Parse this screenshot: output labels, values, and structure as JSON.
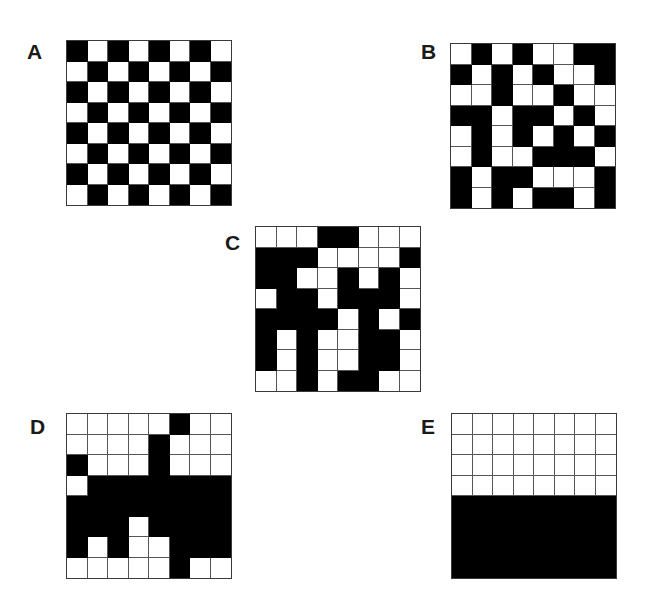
{
  "colors": {
    "filled": "#000000",
    "empty": "#ffffff",
    "gridline": "#555555"
  },
  "panels": [
    {
      "id": "A",
      "label": "A",
      "label_pos": [
        27,
        41
      ],
      "grid_pos": [
        66,
        40
      ],
      "rows": [
        [
          1,
          0,
          1,
          0,
          1,
          0,
          1,
          0
        ],
        [
          0,
          1,
          0,
          1,
          0,
          1,
          0,
          1
        ],
        [
          1,
          0,
          1,
          0,
          1,
          0,
          1,
          0
        ],
        [
          0,
          1,
          0,
          1,
          0,
          1,
          0,
          1
        ],
        [
          1,
          0,
          1,
          0,
          1,
          0,
          1,
          0
        ],
        [
          0,
          1,
          0,
          1,
          0,
          1,
          0,
          1
        ],
        [
          1,
          0,
          1,
          0,
          1,
          0,
          1,
          0
        ],
        [
          0,
          1,
          0,
          1,
          0,
          1,
          0,
          1
        ]
      ]
    },
    {
      "id": "B",
      "label": "B",
      "label_pos": [
        421,
        41
      ],
      "grid_pos": [
        450,
        43
      ],
      "rows": [
        [
          0,
          1,
          0,
          1,
          0,
          0,
          1,
          1
        ],
        [
          1,
          0,
          1,
          0,
          1,
          0,
          0,
          1
        ],
        [
          0,
          0,
          1,
          0,
          0,
          1,
          0,
          0
        ],
        [
          1,
          1,
          0,
          1,
          1,
          0,
          1,
          0
        ],
        [
          0,
          1,
          0,
          1,
          0,
          1,
          0,
          1
        ],
        [
          0,
          1,
          0,
          0,
          1,
          1,
          1,
          0
        ],
        [
          1,
          0,
          1,
          1,
          0,
          0,
          0,
          1
        ],
        [
          1,
          0,
          1,
          0,
          1,
          1,
          0,
          1
        ]
      ]
    },
    {
      "id": "C",
      "label": "C",
      "label_pos": [
        225,
        232
      ],
      "grid_pos": [
        255,
        226
      ],
      "rows": [
        [
          0,
          0,
          0,
          1,
          1,
          0,
          0,
          0
        ],
        [
          1,
          1,
          1,
          0,
          0,
          0,
          0,
          1
        ],
        [
          1,
          1,
          0,
          0,
          1,
          0,
          1,
          0
        ],
        [
          0,
          1,
          1,
          0,
          1,
          1,
          1,
          0
        ],
        [
          1,
          1,
          1,
          1,
          0,
          1,
          0,
          1
        ],
        [
          1,
          0,
          1,
          0,
          0,
          1,
          1,
          0
        ],
        [
          1,
          0,
          1,
          0,
          0,
          1,
          1,
          0
        ],
        [
          0,
          0,
          1,
          0,
          1,
          1,
          0,
          0
        ]
      ]
    },
    {
      "id": "D",
      "label": "D",
      "label_pos": [
        30,
        416
      ],
      "grid_pos": [
        66,
        413
      ],
      "rows": [
        [
          0,
          0,
          0,
          0,
          0,
          1,
          0,
          0
        ],
        [
          0,
          0,
          0,
          0,
          1,
          0,
          0,
          0
        ],
        [
          1,
          0,
          0,
          0,
          1,
          0,
          0,
          0
        ],
        [
          0,
          1,
          1,
          1,
          1,
          1,
          1,
          1
        ],
        [
          1,
          1,
          1,
          1,
          1,
          1,
          1,
          1
        ],
        [
          1,
          1,
          1,
          0,
          1,
          1,
          1,
          1
        ],
        [
          1,
          0,
          1,
          0,
          0,
          1,
          1,
          1
        ],
        [
          0,
          0,
          0,
          0,
          0,
          1,
          0,
          0
        ]
      ]
    },
    {
      "id": "E",
      "label": "E",
      "label_pos": [
        421,
        416
      ],
      "grid_pos": [
        451,
        413
      ],
      "rows": [
        [
          0,
          0,
          0,
          0,
          0,
          0,
          0,
          0
        ],
        [
          0,
          0,
          0,
          0,
          0,
          0,
          0,
          0
        ],
        [
          0,
          0,
          0,
          0,
          0,
          0,
          0,
          0
        ],
        [
          0,
          0,
          0,
          0,
          0,
          0,
          0,
          0
        ],
        [
          1,
          1,
          1,
          1,
          1,
          1,
          1,
          1
        ],
        [
          1,
          1,
          1,
          1,
          1,
          1,
          1,
          1
        ],
        [
          1,
          1,
          1,
          1,
          1,
          1,
          1,
          1
        ],
        [
          1,
          1,
          1,
          1,
          1,
          1,
          1,
          1
        ]
      ]
    }
  ]
}
